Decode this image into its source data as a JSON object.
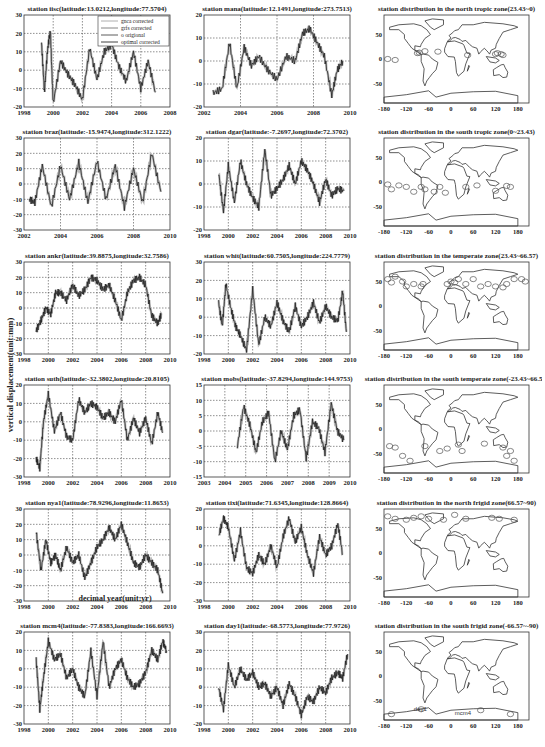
{
  "figure": {
    "ylabel": "vertical displacement(unit:mm)",
    "xlabel": "decimal year(unit:yr)"
  },
  "chart_data": [
    {
      "type": "line",
      "title": "station iisc(latitude:13.0212,longitude:77.5704)",
      "xlim": [
        1998,
        2008
      ],
      "ylim": [
        -20,
        30
      ],
      "xticks": [
        1998,
        2000,
        2002,
        2004,
        2006,
        2008
      ],
      "yticks": [
        -20,
        -10,
        0,
        10,
        20,
        30
      ],
      "grid": true,
      "legend": [
        "gnca corrected",
        "grfs corrected",
        "o origional",
        "optimal corrected"
      ],
      "legend_position": "upper right",
      "series": [
        {
          "name": "optimal corrected",
          "x": [
            1999.2,
            1999.4,
            1999.6,
            1999.8,
            2000.0,
            2000.5,
            2001.0,
            2001.5,
            2002.0,
            2002.5,
            2003.0,
            2003.5,
            2004.0,
            2004.5,
            2005.0,
            2005.5,
            2006.0,
            2006.5,
            2007.0
          ],
          "y": [
            15,
            -12,
            10,
            22,
            -18,
            5,
            -2,
            -8,
            -16,
            12,
            -5,
            10,
            14,
            2,
            -6,
            10,
            -10,
            5,
            -12
          ]
        }
      ]
    },
    {
      "type": "line",
      "title": "station mana(latitude:12.1491,longitude:273.7513)",
      "xlim": [
        2002,
        2010
      ],
      "ylim": [
        -20,
        20
      ],
      "xticks": [
        2002,
        2004,
        2006,
        2008,
        2010
      ],
      "yticks": [
        -20,
        -10,
        0,
        10,
        20
      ],
      "grid": true,
      "series": [
        {
          "name": "optimal corrected",
          "x": [
            2002.5,
            2003.0,
            2003.4,
            2003.8,
            2004.2,
            2004.6,
            2005.0,
            2005.5,
            2006.0,
            2006.5,
            2007.0,
            2007.4,
            2007.8,
            2008.2,
            2008.6,
            2009.0,
            2009.3,
            2009.6
          ],
          "y": [
            -14,
            -12,
            8,
            -12,
            6,
            -2,
            2,
            -4,
            -8,
            2,
            0,
            12,
            14,
            8,
            2,
            -15,
            -4,
            0
          ]
        }
      ]
    },
    {
      "type": "map",
      "title": "station distribution in the north tropic zone(23.43~0)",
      "xlim": [
        -180,
        210
      ],
      "ylim": [
        -90,
        90
      ],
      "xticks": [
        -180,
        -120,
        -60,
        0,
        60,
        120,
        180
      ],
      "yticks": [
        -50,
        0,
        50
      ]
    },
    {
      "type": "line",
      "title": "station braz(latitude:-15.9474,longitude:312.1222)",
      "xlim": [
        2002,
        2010
      ],
      "ylim": [
        -30,
        30
      ],
      "xticks": [
        2002,
        2004,
        2006,
        2008,
        2010
      ],
      "yticks": [
        -30,
        -20,
        -10,
        0,
        10,
        20,
        30
      ],
      "grid": true,
      "series": [
        {
          "name": "optimal corrected",
          "x": [
            2002.3,
            2002.6,
            2003.0,
            2003.5,
            2004.0,
            2004.5,
            2005.0,
            2005.5,
            2006.0,
            2006.5,
            2007.0,
            2007.5,
            2008.0,
            2008.5,
            2009.0,
            2009.5
          ],
          "y": [
            -10,
            -12,
            12,
            -15,
            12,
            -10,
            14,
            -12,
            15,
            -10,
            12,
            -15,
            10,
            -12,
            20,
            -5
          ]
        }
      ]
    },
    {
      "type": "line",
      "title": "station dgar(latitude:-7.2697,longitude:72.3702)",
      "xlim": [
        1998,
        2010
      ],
      "ylim": [
        -20,
        20
      ],
      "xticks": [
        1998,
        2000,
        2002,
        2004,
        2006,
        2008,
        2010
      ],
      "yticks": [
        -20,
        -10,
        0,
        10,
        20
      ],
      "grid": true,
      "series": [
        {
          "name": "optimal corrected",
          "x": [
            1999.2,
            1999.6,
            2000.0,
            2000.5,
            2001.0,
            2001.5,
            2002.0,
            2002.5,
            2003.0,
            2003.5,
            2004.0,
            2004.5,
            2005.0,
            2005.5,
            2006.0,
            2006.5,
            2007.0,
            2007.5,
            2008.0,
            2008.5,
            2009.0,
            2009.5
          ],
          "y": [
            5,
            -12,
            8,
            -8,
            10,
            0,
            -6,
            -10,
            15,
            -5,
            -2,
            2,
            8,
            0,
            10,
            6,
            0,
            -8,
            2,
            -5,
            -2,
            -3
          ]
        }
      ]
    },
    {
      "type": "map",
      "title": "station distribution in the south tropic zone(0~23.43)",
      "xlim": [
        -180,
        210
      ],
      "ylim": [
        -90,
        90
      ],
      "xticks": [
        -180,
        -120,
        -60,
        0,
        60,
        120,
        180
      ],
      "yticks": [
        -50,
        0,
        50
      ]
    },
    {
      "type": "line",
      "title": "station ankr(latitude:39.8875,longitude:32.7586)",
      "xlim": [
        1998,
        2010
      ],
      "ylim": [
        -30,
        30
      ],
      "xticks": [
        1998,
        2000,
        2002,
        2004,
        2006,
        2008,
        2010
      ],
      "yticks": [
        -30,
        -20,
        -10,
        0,
        10,
        20,
        30
      ],
      "grid": true,
      "series": [
        {
          "name": "optimal corrected",
          "x": [
            1999.0,
            1999.4,
            1999.8,
            2000.2,
            2000.6,
            2001.0,
            2001.5,
            2002.0,
            2002.5,
            2003.0,
            2003.5,
            2004.0,
            2004.5,
            2005.0,
            2005.5,
            2006.0,
            2006.5,
            2007.0,
            2007.5,
            2008.0,
            2008.5,
            2009.0,
            2009.3
          ],
          "y": [
            -15,
            -8,
            0,
            -4,
            10,
            10,
            5,
            15,
            8,
            12,
            20,
            18,
            12,
            15,
            5,
            -8,
            10,
            18,
            20,
            15,
            -5,
            -10,
            -4
          ]
        }
      ]
    },
    {
      "type": "line",
      "title": "station whit(latitude:60.7505,longitude:224.7779)",
      "xlim": [
        1998,
        2010
      ],
      "ylim": [
        -20,
        30
      ],
      "xticks": [
        1998,
        2000,
        2002,
        2004,
        2006,
        2008,
        2010
      ],
      "yticks": [
        -20,
        -10,
        0,
        10,
        20,
        30
      ],
      "grid": true,
      "series": [
        {
          "name": "optimal corrected",
          "x": [
            1999.2,
            1999.5,
            1999.8,
            2000.2,
            2000.6,
            2001.0,
            2001.5,
            2002.0,
            2002.5,
            2003.0,
            2003.5,
            2004.0,
            2004.5,
            2005.0,
            2005.5,
            2006.0,
            2006.5,
            2007.0,
            2007.5,
            2008.0,
            2008.5,
            2009.0,
            2009.4,
            2009.7
          ],
          "y": [
            8,
            -5,
            18,
            5,
            -5,
            -10,
            -18,
            15,
            -15,
            0,
            -5,
            8,
            -2,
            -8,
            6,
            -5,
            0,
            8,
            -3,
            6,
            0,
            -2,
            14,
            -8
          ]
        }
      ]
    },
    {
      "type": "map",
      "title": "station distribution in the temperate zone(23.43~66.57)",
      "xlim": [
        -180,
        210
      ],
      "ylim": [
        -90,
        90
      ],
      "xticks": [
        -180,
        -120,
        -60,
        0,
        60,
        120,
        180
      ],
      "yticks": [
        -50,
        0,
        50
      ]
    },
    {
      "type": "line",
      "title": "station suth(latitude:-32.3802,longitude:20.8105)",
      "xlim": [
        1998,
        2010
      ],
      "ylim": [
        -30,
        20
      ],
      "xticks": [
        1998,
        2000,
        2002,
        2004,
        2006,
        2008,
        2010
      ],
      "yticks": [
        -30,
        -20,
        -10,
        0,
        10,
        20
      ],
      "grid": true,
      "series": [
        {
          "name": "optimal corrected",
          "x": [
            1999.0,
            1999.3,
            1999.6,
            2000.0,
            2000.5,
            2001.0,
            2001.5,
            2002.0,
            2002.5,
            2003.0,
            2003.5,
            2004.0,
            2004.5,
            2005.0,
            2005.5,
            2006.0,
            2006.5,
            2007.0,
            2007.5,
            2008.0,
            2008.5,
            2009.0,
            2009.4
          ],
          "y": [
            -20,
            -25,
            0,
            15,
            -5,
            5,
            -8,
            -10,
            12,
            5,
            10,
            8,
            2,
            5,
            0,
            12,
            -10,
            2,
            -6,
            2,
            -12,
            5,
            -6
          ]
        }
      ]
    },
    {
      "type": "line",
      "title": "station mobs(latitude:-37.8294,longitude:144.9753)",
      "xlim": [
        2003,
        2010
      ],
      "ylim": [
        -15,
        15
      ],
      "xticks": [
        2003,
        2004,
        2005,
        2006,
        2007,
        2008,
        2009,
        2010
      ],
      "yticks": [
        -15,
        -10,
        -5,
        0,
        5,
        10,
        15
      ],
      "grid": true,
      "series": [
        {
          "name": "optimal corrected",
          "x": [
            2004.6,
            2004.9,
            2005.2,
            2005.5,
            2005.8,
            2006.1,
            2006.4,
            2006.7,
            2007.0,
            2007.3,
            2007.6,
            2007.9,
            2008.2,
            2008.5,
            2008.8,
            2009.1,
            2009.4,
            2009.7
          ],
          "y": [
            -5,
            8,
            2,
            -7,
            3,
            6,
            -10,
            0,
            -6,
            5,
            7,
            -9,
            3,
            1,
            -7,
            9,
            0,
            -3
          ]
        }
      ]
    },
    {
      "type": "map",
      "title": "station distribution in the south temperate zone(-23.43~66.57)",
      "xlim": [
        -180,
        210
      ],
      "ylim": [
        -90,
        90
      ],
      "xticks": [
        -180,
        -120,
        -60,
        0,
        60,
        120,
        180
      ],
      "yticks": [
        -50,
        0,
        50
      ]
    },
    {
      "type": "line",
      "title": "station nya1(latitude:78.9296,longitude:11.8653)",
      "xlim": [
        1998,
        2010
      ],
      "ylim": [
        -30,
        30
      ],
      "xticks": [
        1998,
        2000,
        2002,
        2004,
        2006,
        2008,
        2010
      ],
      "yticks": [
        -30,
        -20,
        -10,
        0,
        10,
        20,
        30
      ],
      "grid": true,
      "series": [
        {
          "name": "optimal corrected",
          "x": [
            1999.0,
            1999.4,
            1999.8,
            2000.2,
            2000.6,
            2001.0,
            2001.5,
            2002.0,
            2002.5,
            2003.0,
            2003.5,
            2004.0,
            2004.5,
            2005.0,
            2005.5,
            2006.0,
            2006.5,
            2007.0,
            2007.5,
            2008.0,
            2008.5,
            2009.0,
            2009.4
          ],
          "y": [
            15,
            -10,
            10,
            -5,
            0,
            -10,
            5,
            -5,
            0,
            -15,
            -5,
            5,
            10,
            18,
            10,
            20,
            8,
            -5,
            -8,
            0,
            -5,
            -10,
            -25
          ]
        }
      ]
    },
    {
      "type": "line",
      "title": "station tixi(latitude:71.6345,longitude:128.8664)",
      "xlim": [
        1998,
        2010
      ],
      "ylim": [
        -30,
        20
      ],
      "xticks": [
        1998,
        2000,
        2002,
        2004,
        2006,
        2008,
        2010
      ],
      "yticks": [
        -30,
        -20,
        -10,
        0,
        10,
        20
      ],
      "grid": true,
      "series": [
        {
          "name": "optimal corrected",
          "x": [
            1999.2,
            1999.6,
            2000.0,
            2000.5,
            2001.0,
            2001.5,
            2002.0,
            2002.5,
            2003.0,
            2003.5,
            2004.0,
            2004.5,
            2005.0,
            2005.5,
            2006.0,
            2006.5,
            2007.0,
            2007.5,
            2008.0,
            2008.5,
            2009.0,
            2009.4
          ],
          "y": [
            5,
            15,
            10,
            -8,
            8,
            -12,
            -15,
            -5,
            -10,
            0,
            -12,
            5,
            15,
            2,
            10,
            -5,
            -15,
            5,
            -5,
            0,
            12,
            -5
          ]
        }
      ]
    },
    {
      "type": "map",
      "title": "station distribution in the north frigid zone(66.57~90)",
      "xlim": [
        -180,
        210
      ],
      "ylim": [
        -90,
        90
      ],
      "xticks": [
        -180,
        -120,
        -60,
        0,
        60,
        120,
        180
      ],
      "yticks": [
        -50,
        0,
        50
      ]
    },
    {
      "type": "line",
      "title": "station mcm4(latitude:-77.8383,longitude:166.6693)",
      "xlim": [
        1998,
        2010
      ],
      "ylim": [
        -30,
        20
      ],
      "xticks": [
        1998,
        2000,
        2002,
        2004,
        2006,
        2008,
        2010
      ],
      "yticks": [
        -30,
        -20,
        -10,
        0,
        10,
        20
      ],
      "grid": true,
      "series": [
        {
          "name": "optimal corrected",
          "x": [
            1999.0,
            1999.3,
            1999.6,
            2000.0,
            2000.5,
            2001.0,
            2001.5,
            2002.0,
            2002.5,
            2003.0,
            2003.5,
            2004.0,
            2004.5,
            2005.0,
            2005.5,
            2006.0,
            2006.5,
            2007.0,
            2007.5,
            2008.0,
            2008.5,
            2009.0,
            2009.4,
            2009.7
          ],
          "y": [
            5,
            -22,
            -5,
            15,
            5,
            8,
            -5,
            0,
            -10,
            -15,
            10,
            -15,
            15,
            -10,
            0,
            5,
            -5,
            -10,
            -8,
            -2,
            10,
            5,
            15,
            10
          ]
        }
      ]
    },
    {
      "type": "line",
      "title": "station day1(latitude:-68.5773,longitude:77.9726)",
      "xlim": [
        1998,
        2010
      ],
      "ylim": [
        -20,
        30
      ],
      "xticks": [
        1998,
        2000,
        2002,
        2004,
        2006,
        2008,
        2010
      ],
      "yticks": [
        -20,
        -10,
        0,
        10,
        20,
        30
      ],
      "grid": true,
      "series": [
        {
          "name": "optimal corrected",
          "x": [
            1999.2,
            1999.6,
            2000.0,
            2000.5,
            2001.0,
            2001.5,
            2002.0,
            2002.5,
            2003.0,
            2003.5,
            2004.0,
            2004.5,
            2005.0,
            2005.5,
            2006.0,
            2006.5,
            2007.0,
            2007.5,
            2008.0,
            2008.5,
            2009.0,
            2009.4,
            2009.8
          ],
          "y": [
            0,
            -12,
            12,
            0,
            10,
            4,
            8,
            0,
            2,
            -5,
            0,
            -10,
            2,
            -5,
            -15,
            -5,
            -8,
            0,
            -3,
            5,
            8,
            5,
            18
          ]
        }
      ]
    },
    {
      "type": "map",
      "title": "station distribution in the south frigid zone(-66.57~-90)",
      "xlim": [
        -180,
        210
      ],
      "ylim": [
        -90,
        90
      ],
      "xticks": [
        -180,
        -120,
        -60,
        0,
        60,
        120,
        180
      ],
      "yticks": [
        -50,
        0,
        50
      ],
      "annotations": [
        "day1",
        "mcm4"
      ]
    }
  ]
}
